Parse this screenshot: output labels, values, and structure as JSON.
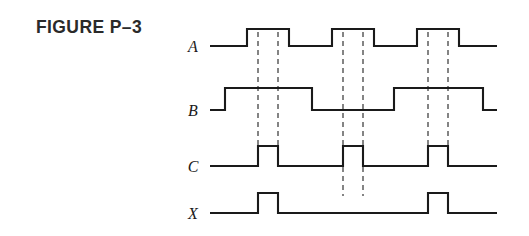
{
  "figure": {
    "caption": "FIGURE P–3",
    "background_color": "#ffffff",
    "line_color": "#1a1a1a",
    "marker_color": "#2b2b2b"
  },
  "signals": [
    {
      "name": "A",
      "label": "A"
    },
    {
      "name": "B",
      "label": "B"
    },
    {
      "name": "C",
      "label": "C"
    },
    {
      "name": "X",
      "label": "X"
    }
  ],
  "chart_data": {
    "type": "line",
    "title": "FIGURE P–3",
    "xlabel": "",
    "ylabel": "",
    "grid": false,
    "legend_position": "left",
    "x_axis_range": [
      210,
      497
    ],
    "trace_baselines": {
      "A": 46,
      "B": 110,
      "C": 166,
      "X": 213
    },
    "trace_high_offset": 17,
    "series": [
      {
        "name": "A",
        "label": "A",
        "label_x": 193,
        "label_y": 52,
        "baseline_y": 46,
        "high_y": 29,
        "start_x": 210,
        "end_x": 497,
        "initial_level": "low",
        "transitions": [
          247,
          289,
          332,
          374,
          417,
          459
        ],
        "pulses": [
          {
            "start": 247,
            "end": 289
          },
          {
            "start": 332,
            "end": 374
          },
          {
            "start": 417,
            "end": 459
          }
        ]
      },
      {
        "name": "B",
        "label": "B",
        "label_x": 193,
        "label_y": 116,
        "baseline_y": 110,
        "high_y": 88,
        "start_x": 210,
        "end_x": 497,
        "initial_level": "low",
        "transitions": [
          225,
          312,
          394,
          483
        ],
        "pulses": [
          {
            "start": 225,
            "end": 312
          },
          {
            "start": 394,
            "end": 483
          }
        ]
      },
      {
        "name": "C",
        "label": "C",
        "label_x": 193,
        "label_y": 172,
        "baseline_y": 166,
        "high_y": 146,
        "start_x": 210,
        "end_x": 497,
        "initial_level": "low",
        "transitions": [
          258,
          278,
          343,
          363,
          428,
          448
        ],
        "pulses": [
          {
            "start": 258,
            "end": 278
          },
          {
            "start": 343,
            "end": 363
          },
          {
            "start": 428,
            "end": 448
          }
        ]
      },
      {
        "name": "X",
        "label": "X",
        "label_x": 193,
        "label_y": 219,
        "baseline_y": 213,
        "high_y": 193,
        "start_x": 210,
        "end_x": 497,
        "initial_level": "low",
        "transitions": [
          258,
          278,
          428,
          448
        ],
        "pulses": [
          {
            "start": 258,
            "end": 278
          },
          {
            "start": 428,
            "end": 448
          }
        ]
      }
    ],
    "markers": [
      {
        "x": 258,
        "y_top": 32,
        "y_bottom": 146
      },
      {
        "x": 278,
        "y_top": 32,
        "y_bottom": 146
      },
      {
        "x": 343,
        "y_top": 32,
        "y_bottom": 196
      },
      {
        "x": 363,
        "y_top": 32,
        "y_bottom": 196
      },
      {
        "x": 428,
        "y_top": 32,
        "y_bottom": 146
      },
      {
        "x": 448,
        "y_top": 32,
        "y_bottom": 146
      }
    ]
  }
}
